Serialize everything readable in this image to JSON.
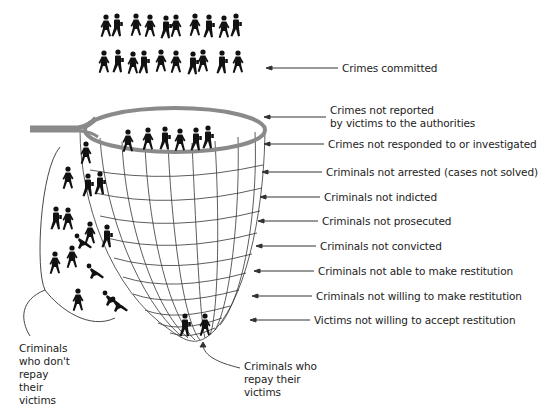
{
  "diagram": {
    "top_crowd": {
      "rows": 2,
      "figures_per_row": 11,
      "label": "Crimes committed"
    },
    "funnel_labels": [
      {
        "id": "not-reported",
        "line1": "Crimes not reported",
        "line2": "by victims to the authorities"
      },
      {
        "id": "not-investigated",
        "text": "Crimes not responded to or investigated"
      },
      {
        "id": "not-arrested",
        "text": "Criminals not arrested (cases not solved)"
      },
      {
        "id": "not-indicted",
        "text": "Criminals not indicted"
      },
      {
        "id": "not-prosecuted",
        "text": "Criminals not prosecuted"
      },
      {
        "id": "not-convicted",
        "text": "Criminals not convicted"
      },
      {
        "id": "not-able",
        "text": "Criminals not able to make restitution"
      },
      {
        "id": "not-willing",
        "text": "Criminals not willing to make restitution"
      },
      {
        "id": "victims-not-willing",
        "text": "Victims not willing to accept restitution"
      }
    ],
    "left_label": {
      "lines": [
        "Criminals",
        "who don't",
        "repay",
        "their",
        "victims"
      ]
    },
    "bottom_label": {
      "lines": [
        "Criminals who",
        "repay their",
        "victims"
      ]
    },
    "colors": {
      "net_rim": "#8a8a8a",
      "net_grid": "#333333",
      "figures": "#111111",
      "text": "#222222"
    }
  }
}
